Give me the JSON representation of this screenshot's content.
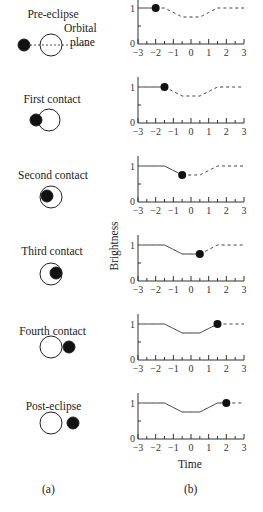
{
  "figure": {
    "panel_a_label": "(a)",
    "panel_b_label": "(b)",
    "y_axis_label": "Brightness",
    "x_axis_label": "Time",
    "orbital_plane_label_1": "Orbital",
    "orbital_plane_label_2": "plane",
    "x_ticks": [
      "−3",
      "−2",
      "−1",
      "0",
      "1",
      "2",
      "3"
    ],
    "y_ticks": [
      "0",
      "1"
    ]
  },
  "panels": [
    {
      "title": "Pre-eclipse",
      "marker_time": -2,
      "marker_brightness": 1
    },
    {
      "title": "First contact",
      "marker_time": -1.5,
      "marker_brightness": 1
    },
    {
      "title": "Second contact",
      "marker_time": -0.5,
      "marker_brightness": 0.75
    },
    {
      "title": "Third contact",
      "marker_time": 0.5,
      "marker_brightness": 0.75
    },
    {
      "title": "Fourth contact",
      "marker_time": 1.5,
      "marker_brightness": 1
    },
    {
      "title": "Post-eclipse",
      "marker_time": 2,
      "marker_brightness": 1
    }
  ],
  "chart_data": {
    "type": "line",
    "xlabel": "Time",
    "ylabel": "Brightness",
    "xlim": [
      -3,
      3
    ],
    "ylim": [
      0,
      1.1
    ],
    "x": [
      -3,
      -1.5,
      -0.5,
      0.5,
      1.5,
      3
    ],
    "series": [
      {
        "name": "Brightness",
        "values": [
          1,
          1,
          0.75,
          0.75,
          1,
          1
        ]
      }
    ]
  }
}
